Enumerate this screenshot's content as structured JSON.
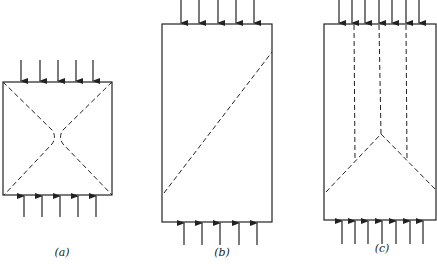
{
  "figure": {
    "panels": [
      {
        "id": "a",
        "label": "(a)",
        "description": "Square specimen under uniaxial compression, X-shaped (cone) failure planes"
      },
      {
        "id": "b",
        "label": "(b)",
        "description": "Tall specimen with single inclined shear failure plane"
      },
      {
        "id": "c",
        "label": "(c)",
        "description": "Tall specimen with vertical splitting cracks and wedge (V) failure"
      }
    ],
    "colors": {
      "line": "#222222",
      "background": "#ffffff"
    }
  }
}
